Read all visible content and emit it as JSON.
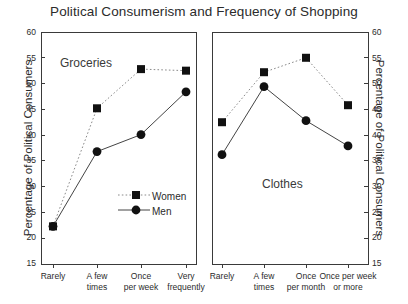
{
  "chart_data": {
    "type": "line",
    "title": "Political Consumerism and Frequency of Shopping",
    "ylabel": "Percentage of Political Consumers",
    "ylabel_right": "Percentage of Political Consumers",
    "ylim": [
      15,
      60
    ],
    "yticks": [
      15,
      20,
      25,
      30,
      35,
      40,
      45,
      50,
      55,
      60
    ],
    "grid": false,
    "legend": {
      "position": "inside-lower-center-left-panel",
      "entries": [
        {
          "name": "Women",
          "marker": "filled-square",
          "line": "dotted"
        },
        {
          "name": "Men",
          "marker": "filled-circle",
          "line": "solid"
        }
      ]
    },
    "panels": [
      {
        "label": "Groceries",
        "xlabel": "",
        "categories": [
          "Rarely",
          "A few times",
          "Once per week",
          "Very frequently"
        ],
        "category_lines": [
          [
            "Rarely"
          ],
          [
            "A few",
            "times"
          ],
          [
            "Once",
            "per week"
          ],
          [
            "Very",
            "frequently"
          ]
        ],
        "series": [
          {
            "name": "Women",
            "values": [
              22.3,
              45.2,
              52.8,
              52.5
            ]
          },
          {
            "name": "Men",
            "values": [
              22.3,
              36.8,
              40.1,
              48.4
            ]
          }
        ]
      },
      {
        "label": "Clothes",
        "xlabel": "",
        "categories": [
          "Rarely",
          "A few times",
          "Once per month",
          "Once per week or more"
        ],
        "category_lines": [
          [
            "Rarely"
          ],
          [
            "A few",
            "times"
          ],
          [
            "Once",
            "per month"
          ],
          [
            "Once per week",
            "or more"
          ]
        ],
        "series": [
          {
            "name": "Women",
            "values": [
              42.5,
              52.2,
              55.0,
              45.8
            ]
          },
          {
            "name": "Men",
            "values": [
              36.2,
              49.4,
              42.8,
              37.9
            ]
          }
        ]
      }
    ]
  },
  "colors": {
    "axis": "#3a3a3a",
    "marker": "#111111",
    "text": "#2b2b2b",
    "background": "#ffffff"
  },
  "ticks": {
    "y": [
      "60",
      "55",
      "50",
      "45",
      "40",
      "35",
      "30",
      "25",
      "20",
      "15"
    ]
  },
  "legend": {
    "women": "Women",
    "men": "Men"
  },
  "panel_labels": {
    "left": "Groceries",
    "right": "Clothes"
  },
  "xlabels_left": {
    "a1": "Rarely",
    "a2": "",
    "b1": "A few",
    "b2": "times",
    "c1": "Once",
    "c2": "per week",
    "d1": "Very",
    "d2": "frequently"
  },
  "xlabels_right": {
    "a1": "Rarely",
    "a2": "",
    "b1": "A few",
    "b2": "times",
    "c1": "Once",
    "c2": "per month",
    "d1": "Once per week",
    "d2": "or more"
  }
}
